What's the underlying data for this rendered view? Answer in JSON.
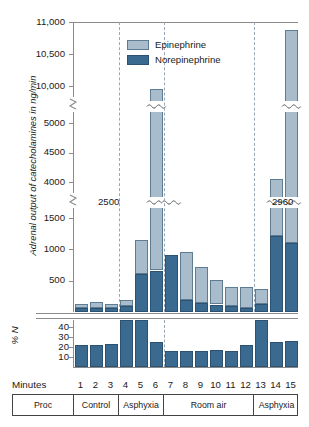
{
  "chart_data": {
    "type": "bar",
    "title": "",
    "ylabel": "Adrenal output of catecholamines in ng/min",
    "xlabel": "Minutes",
    "categories": [
      "1",
      "2",
      "3",
      "4",
      "5",
      "6",
      "7",
      "8",
      "9",
      "10",
      "11",
      "12",
      "13",
      "14",
      "15"
    ],
    "stacked": true,
    "legend_position": "top-center",
    "grid": false,
    "axis_breaks": [
      [
        1500,
        4000
      ],
      [
        5000,
        10000
      ]
    ],
    "yticks": [
      500,
      1000,
      1500,
      4000,
      4500,
      5000,
      10000,
      10500,
      11000
    ],
    "ytick_labels": [
      "500",
      "1000",
      "1500",
      "4000",
      "4500",
      "5000",
      "10,000",
      "10,500",
      "11,000"
    ],
    "ylim": [
      0,
      11000
    ],
    "series": [
      {
        "name": "Norepinephrine",
        "color": "#3a6a8f",
        "values": [
          60,
          70,
          60,
          95,
          600,
          2500,
          910,
          185,
          145,
          120,
          95,
          60,
          130,
          1215,
          2960
        ]
      },
      {
        "name": "Epinephrine",
        "color": "#a8bccc",
        "values": [
          75,
          85,
          75,
          100,
          550,
          7450,
          4190,
          775,
          580,
          395,
          305,
          335,
          235,
          2845,
          7920
        ]
      }
    ],
    "totals": [
      135,
      155,
      135,
      195,
      1150,
      9950,
      5100,
      960,
      725,
      515,
      400,
      395,
      365,
      4060,
      10880
    ],
    "truncation_annotations": [
      {
        "label": "2500",
        "minute": 6,
        "side": "left"
      },
      {
        "label": "2960",
        "minute": 15,
        "side": "right"
      }
    ],
    "percent_panel": {
      "ylabel": "% N",
      "yticks": [
        10,
        20,
        30,
        40
      ],
      "ytick_labels": [
        "10",
        "20",
        "30",
        "40"
      ],
      "ylim": [
        0,
        47
      ],
      "values": [
        22,
        22,
        23,
        47,
        47,
        25,
        16,
        16,
        16,
        17,
        16.5,
        22.5,
        47,
        25,
        26
      ],
      "color": "#3a6a8f"
    },
    "phase_dividers_after_minute": [
      3,
      6,
      12
    ],
    "procedures": [
      {
        "label": "Proc",
        "from": 0,
        "to": 0,
        "is_header": true
      },
      {
        "label": "Control",
        "from": 1,
        "to": 3,
        "is_header": false
      },
      {
        "label": "Asphyxia",
        "from": 4,
        "to": 6,
        "is_header": false
      },
      {
        "label": "Room air",
        "from": 7,
        "to": 12,
        "is_header": false
      },
      {
        "label": "Asphyxia",
        "from": 13,
        "to": 15,
        "is_header": false
      }
    ]
  },
  "legend": {
    "items": [
      {
        "label": "Epinephrine",
        "color": "#a8bccc"
      },
      {
        "label": "Norepinephrine",
        "color": "#3a6a8f"
      }
    ]
  },
  "axis": {
    "y_title": "Adrenal output of catecholamines in ng/min",
    "percent_title": "% N",
    "minutes_label": "Minutes"
  }
}
